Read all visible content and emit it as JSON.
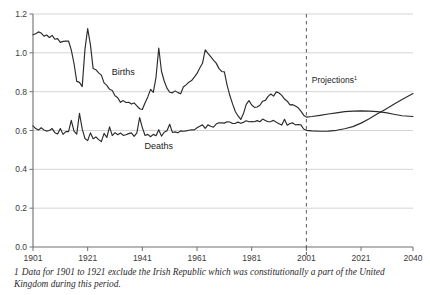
{
  "chart_data": {
    "type": "line",
    "title": "",
    "subtitle": "",
    "xlabel": "",
    "ylabel": "",
    "xlim": [
      1901,
      2040
    ],
    "ylim": [
      0.0,
      1.2
    ],
    "grid": true,
    "legend_position": "inline-annotations",
    "y_ticks": [
      "0.0",
      "0.2",
      "0.4",
      "0.6",
      "0.8",
      "1.0",
      "1.2"
    ],
    "y_tick_values": [
      0.0,
      0.2,
      0.4,
      0.6,
      0.8,
      1.0,
      1.2
    ],
    "x_ticks": [
      "1901",
      "1921",
      "1941",
      "1961",
      "1981",
      "2001",
      "2021",
      "2040"
    ],
    "x_tick_values": [
      1901,
      1921,
      1941,
      1961,
      1981,
      2001,
      2021,
      2040
    ],
    "annotations": [
      {
        "name": "births-label",
        "text": "Births",
        "x": 1934,
        "y": 0.885
      },
      {
        "name": "deaths-label",
        "text": "Deaths",
        "x": 1947,
        "y": 0.505
      },
      {
        "name": "projections-label",
        "text": "Projections",
        "superscript": "1",
        "x": 2003,
        "y": 0.845
      }
    ],
    "projection_divider": {
      "x": 2001,
      "label": "Projections"
    },
    "series": [
      {
        "name": "Births",
        "x": [
          1901,
          1902,
          1903,
          1904,
          1905,
          1906,
          1907,
          1908,
          1909,
          1910,
          1911,
          1912,
          1913,
          1914,
          1915,
          1916,
          1917,
          1918,
          1919,
          1920,
          1921,
          1922,
          1923,
          1924,
          1925,
          1926,
          1927,
          1928,
          1929,
          1930,
          1931,
          1932,
          1933,
          1934,
          1935,
          1936,
          1937,
          1938,
          1939,
          1940,
          1941,
          1942,
          1943,
          1944,
          1945,
          1946,
          1947,
          1948,
          1949,
          1950,
          1951,
          1952,
          1953,
          1954,
          1955,
          1956,
          1957,
          1958,
          1959,
          1960,
          1961,
          1962,
          1963,
          1964,
          1965,
          1966,
          1967,
          1968,
          1969,
          1970,
          1971,
          1972,
          1973,
          1974,
          1975,
          1976,
          1977,
          1978,
          1979,
          1980,
          1981,
          1982,
          1983,
          1984,
          1985,
          1986,
          1987,
          1988,
          1989,
          1990,
          1991,
          1992,
          1993,
          1994,
          1995,
          1996,
          1997,
          1998,
          1999,
          2000,
          2001,
          2003,
          2006,
          2009,
          2012,
          2015,
          2018,
          2021,
          2024,
          2027,
          2030,
          2033,
          2036,
          2040
        ],
        "values": [
          1.093,
          1.098,
          1.108,
          1.102,
          1.086,
          1.092,
          1.079,
          1.09,
          1.07,
          1.073,
          1.054,
          1.059,
          1.06,
          1.061,
          1.015,
          0.945,
          0.853,
          0.848,
          0.826,
          1.018,
          1.125,
          1.042,
          0.919,
          0.913,
          0.897,
          0.885,
          0.845,
          0.832,
          0.812,
          0.806,
          0.779,
          0.769,
          0.745,
          0.754,
          0.744,
          0.745,
          0.736,
          0.742,
          0.727,
          0.712,
          0.708,
          0.743,
          0.773,
          0.812,
          0.796,
          0.874,
          1.025,
          0.905,
          0.855,
          0.818,
          0.797,
          0.794,
          0.804,
          0.795,
          0.789,
          0.824,
          0.835,
          0.849,
          0.857,
          0.875,
          0.894,
          0.922,
          0.946,
          1.015,
          0.997,
          0.98,
          0.962,
          0.947,
          0.92,
          0.904,
          0.902,
          0.834,
          0.78,
          0.737,
          0.698,
          0.675,
          0.657,
          0.687,
          0.735,
          0.754,
          0.731,
          0.719,
          0.721,
          0.73,
          0.751,
          0.755,
          0.776,
          0.788,
          0.777,
          0.799,
          0.793,
          0.781,
          0.762,
          0.751,
          0.732,
          0.733,
          0.726,
          0.717,
          0.7,
          0.679,
          0.669,
          0.672,
          0.678,
          0.685,
          0.691,
          0.697,
          0.7,
          0.701,
          0.7,
          0.697,
          0.692,
          0.684,
          0.676,
          0.672
        ],
        "style": "solid",
        "color": "#2b2b2b"
      },
      {
        "name": "Deaths",
        "x": [
          1901,
          1902,
          1903,
          1904,
          1905,
          1906,
          1907,
          1908,
          1909,
          1910,
          1911,
          1912,
          1913,
          1914,
          1915,
          1916,
          1917,
          1918,
          1919,
          1920,
          1921,
          1922,
          1923,
          1924,
          1925,
          1926,
          1927,
          1928,
          1929,
          1930,
          1931,
          1932,
          1933,
          1934,
          1935,
          1936,
          1937,
          1938,
          1939,
          1940,
          1941,
          1942,
          1943,
          1944,
          1945,
          1946,
          1947,
          1948,
          1949,
          1950,
          1951,
          1952,
          1953,
          1954,
          1955,
          1956,
          1957,
          1958,
          1959,
          1960,
          1961,
          1962,
          1963,
          1964,
          1965,
          1966,
          1967,
          1968,
          1969,
          1970,
          1971,
          1972,
          1973,
          1974,
          1975,
          1976,
          1977,
          1978,
          1979,
          1980,
          1981,
          1982,
          1983,
          1984,
          1985,
          1986,
          1987,
          1988,
          1989,
          1990,
          1991,
          1992,
          1993,
          1994,
          1995,
          1996,
          1997,
          1998,
          1999,
          2000,
          2001,
          2003,
          2006,
          2009,
          2012,
          2015,
          2018,
          2021,
          2024,
          2027,
          2030,
          2033,
          2036,
          2040
        ],
        "values": [
          0.624,
          0.61,
          0.602,
          0.614,
          0.603,
          0.597,
          0.6,
          0.61,
          0.589,
          0.582,
          0.61,
          0.58,
          0.594,
          0.594,
          0.652,
          0.597,
          0.581,
          0.688,
          0.608,
          0.559,
          0.548,
          0.588,
          0.557,
          0.567,
          0.553,
          0.543,
          0.585,
          0.564,
          0.619,
          0.574,
          0.589,
          0.578,
          0.587,
          0.575,
          0.578,
          0.584,
          0.588,
          0.57,
          0.588,
          0.667,
          0.615,
          0.574,
          0.58,
          0.568,
          0.58,
          0.573,
          0.604,
          0.571,
          0.591,
          0.599,
          0.632,
          0.59,
          0.593,
          0.588,
          0.598,
          0.596,
          0.598,
          0.601,
          0.604,
          0.603,
          0.614,
          0.622,
          0.629,
          0.611,
          0.629,
          0.622,
          0.617,
          0.633,
          0.64,
          0.639,
          0.638,
          0.645,
          0.644,
          0.636,
          0.637,
          0.643,
          0.637,
          0.642,
          0.65,
          0.645,
          0.646,
          0.645,
          0.651,
          0.645,
          0.659,
          0.652,
          0.645,
          0.646,
          0.652,
          0.642,
          0.635,
          0.628,
          0.658,
          0.627,
          0.636,
          0.639,
          0.629,
          0.631,
          0.629,
          0.608,
          0.601,
          0.598,
          0.596,
          0.597,
          0.601,
          0.609,
          0.62,
          0.638,
          0.661,
          0.686,
          0.71,
          0.735,
          0.76,
          0.79
        ],
        "style": "solid",
        "color": "#2b2b2b"
      }
    ]
  },
  "footnote": {
    "marker": "1",
    "text": "Data for 1901 to 1921 exclude the Irish Republic which was constitutionally a part of the United Kingdom during this period."
  }
}
